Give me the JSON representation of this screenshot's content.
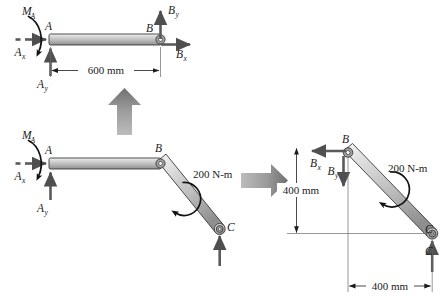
{
  "figure": {
    "background_color": "#ffffff",
    "bar_fill_light": "#e2e2e2",
    "bar_fill_dark": "#8c8c8c",
    "arrow_color": "#5a5a5a",
    "big_arrow_color": "#8f8f8f",
    "ink_color": "#1b1b1b"
  },
  "panels": {
    "top_left": {
      "name": "free-body-diagram-member-AB",
      "labels": {
        "moment_MA": "M",
        "moment_MA_sub": "A",
        "force_Ax": "A",
        "force_Ax_sub": "x",
        "force_Ay": "A",
        "force_Ay_sub": "y",
        "joint_A": "A",
        "joint_B": "B",
        "force_Bx": "B",
        "force_Bx_sub": "x",
        "force_By": "B",
        "force_By_sub": "y"
      },
      "dimension": "600 mm"
    },
    "middle_left": {
      "name": "free-body-diagram-full-bar-ABC",
      "labels": {
        "moment_MA": "M",
        "moment_MA_sub": "A",
        "force_Ax": "A",
        "force_Ax_sub": "x",
        "force_Ay": "A",
        "force_Ay_sub": "y",
        "joint_A": "A",
        "joint_B": "B",
        "joint_C": "C"
      },
      "applied_moment": "200 N-m"
    },
    "right": {
      "name": "free-body-diagram-member-BC",
      "labels": {
        "joint_B": "B",
        "force_Bx": "B",
        "force_Bx_sub": "x",
        "force_By": "B",
        "force_By_sub": "y",
        "joint_C": "C",
        "force_C": "C"
      },
      "applied_moment": "200 N-m",
      "dimension_vertical": "400 mm",
      "dimension_horizontal": "400 mm"
    }
  },
  "transition_arrows": [
    {
      "name": "arrow-up-decompose",
      "direction": "up"
    },
    {
      "name": "arrow-right-decompose",
      "direction": "right"
    }
  ]
}
